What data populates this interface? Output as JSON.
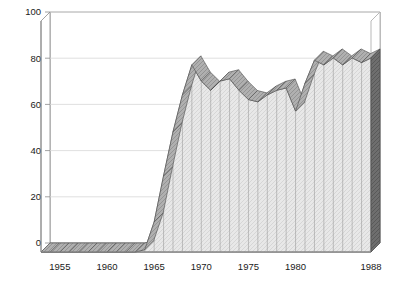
{
  "chart_data": {
    "type": "area",
    "title": "",
    "subtitle": "",
    "xlabel": "",
    "ylabel": "",
    "xlim": [
      1953,
      1988
    ],
    "ylim": [
      0,
      100
    ],
    "grid": true,
    "legend": null,
    "style": "3d-ribbon-area",
    "x": [
      1953,
      1954,
      1955,
      1956,
      1957,
      1958,
      1959,
      1960,
      1961,
      1962,
      1963,
      1964,
      1965,
      1966,
      1967,
      1968,
      1969,
      1970,
      1971,
      1972,
      1973,
      1974,
      1975,
      1976,
      1977,
      1978,
      1979,
      1980,
      1981,
      1982,
      1983,
      1984,
      1985,
      1986,
      1987,
      1988
    ],
    "values": [
      0,
      0,
      0,
      0,
      0,
      0,
      0,
      0,
      0,
      0,
      0,
      1,
      13,
      33,
      52,
      68,
      81,
      74,
      70,
      74,
      75,
      70,
      66,
      65,
      68,
      70,
      71,
      61,
      73,
      83,
      81,
      84,
      81,
      84,
      82,
      84
    ],
    "series": [
      {
        "name": "value",
        "values": [
          0,
          0,
          0,
          0,
          0,
          0,
          0,
          0,
          0,
          0,
          0,
          1,
          13,
          33,
          52,
          68,
          81,
          74,
          70,
          74,
          75,
          70,
          66,
          65,
          68,
          70,
          71,
          61,
          73,
          83,
          81,
          84,
          81,
          84,
          82,
          84
        ]
      }
    ],
    "y_ticks": [
      0,
      20,
      40,
      60,
      80,
      100
    ],
    "y_tick_labels": [
      "0",
      "20",
      "40",
      "60",
      "80",
      "100"
    ],
    "x_ticks": [
      1955,
      1960,
      1965,
      1970,
      1975,
      1980,
      1988
    ],
    "x_tick_labels": [
      "1955",
      "1960",
      "1965",
      "1970",
      "1975",
      "1980",
      "1988"
    ],
    "colors": {
      "area_face": "#e8e8e8",
      "ribbon_top": "#b0b0b0",
      "side_face": "#6e6e6e",
      "outline": "#4d4d4d",
      "gridline": "#d8d8d8",
      "axis": "#8a8a8a",
      "text": "#1a1a1a",
      "background": "#ffffff"
    }
  }
}
